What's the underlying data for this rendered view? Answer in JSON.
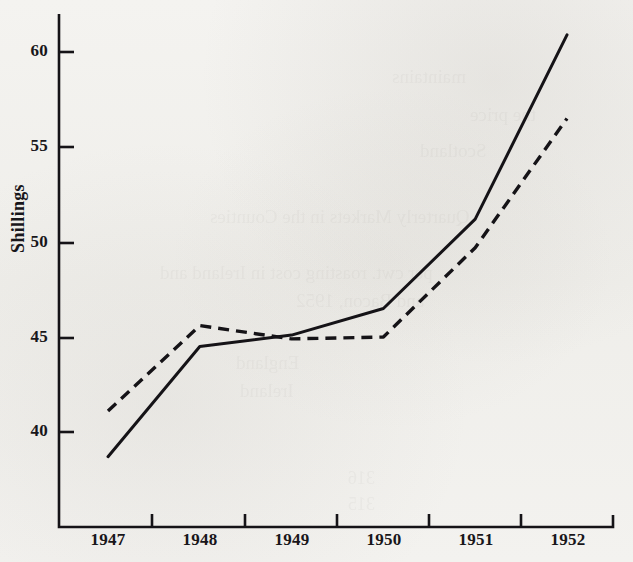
{
  "chart_data": {
    "type": "line",
    "title": "",
    "xlabel": "",
    "ylabel": "Shillings",
    "categories": [
      "1947",
      "1948",
      "1949",
      "1950",
      "1951",
      "1952"
    ],
    "ylim": [
      36.5,
      62.5
    ],
    "yticks": [
      40,
      45,
      50,
      55,
      60
    ],
    "ytick_labels": [
      "40",
      "45",
      "50",
      "55",
      "60"
    ],
    "grid": false,
    "legend": "none",
    "series": [
      {
        "name": "solid-line",
        "style": "solid",
        "color": "#151317",
        "values": [
          38.7,
          44.5,
          45.1,
          46.5,
          51.2,
          60.9
        ]
      },
      {
        "name": "dashed-line",
        "style": "dashed",
        "color": "#151317",
        "values": [
          41.1,
          45.6,
          44.9,
          45.0,
          49.7,
          56.5
        ]
      }
    ],
    "annotations": []
  },
  "axis": {
    "y_title": "Shillings",
    "y_tick_labels": [
      "60",
      "55",
      "50",
      "45",
      "40"
    ],
    "x_tick_labels": [
      "1947",
      "1948",
      "1949",
      "1950",
      "1951",
      "1952"
    ]
  },
  "page": {
    "background_color": "#f2f1ee",
    "ink_color": "#151317",
    "bleed_through_text": ""
  }
}
